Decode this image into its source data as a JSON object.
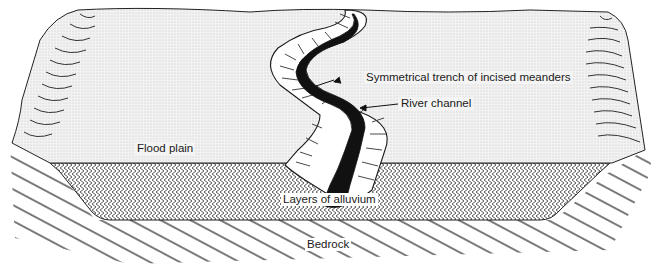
{
  "diagram": {
    "labels": {
      "trench": "Symmetrical trench of incised meanders",
      "channel": "River channel",
      "flood_plain": "Flood plain",
      "alluvium": "Layers of alluvium",
      "bedrock": "Bedrock"
    },
    "colors": {
      "ink": "#1a1a1a",
      "flood_plain_fill": "#ececec",
      "alluvium_fill": "#ffffff",
      "background": "#ffffff"
    }
  }
}
